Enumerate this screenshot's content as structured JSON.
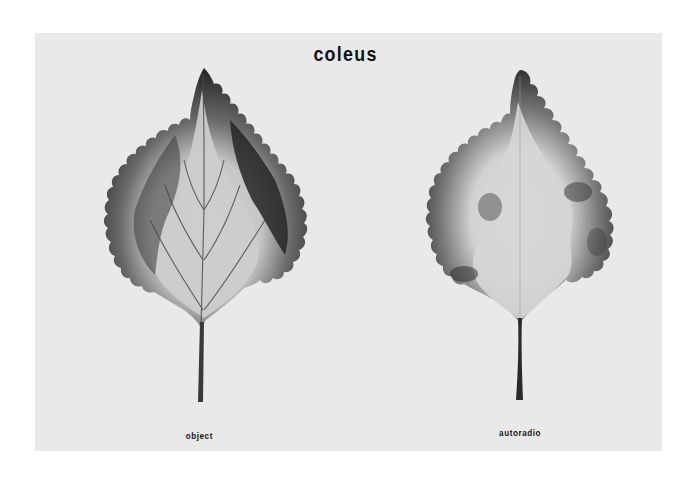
{
  "figure": {
    "title": "coleus",
    "panels": [
      {
        "id": "left",
        "label": "object",
        "description": "photograph of variegated coleus leaf"
      },
      {
        "id": "right",
        "label": "autoradio",
        "description": "autoradiograph of the same coleus leaf"
      }
    ]
  },
  "colors": {
    "background": "#ffffff",
    "panel": "#e9e9e9",
    "leaf_dark": "#2e2e2e",
    "leaf_light": "#c8c8c8",
    "text": "#111111"
  }
}
